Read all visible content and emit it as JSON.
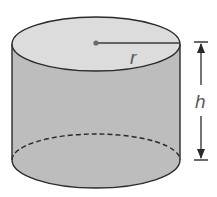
{
  "diagram": {
    "shape": "cylinder",
    "labels": {
      "radius": "r",
      "height": "h"
    },
    "colors": {
      "top_face": "#dcdcdc",
      "side": "#bdbdbd",
      "outline": "#2a2a2a",
      "label": "#5a5a5a",
      "background": "#ffffff"
    }
  }
}
